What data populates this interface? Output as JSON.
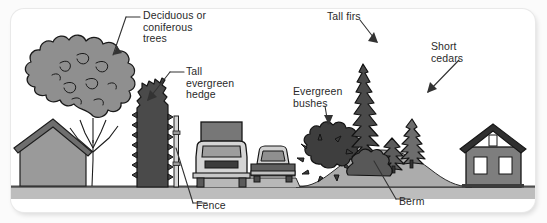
{
  "figure": {
    "width": 547,
    "height": 223
  },
  "colors": {
    "background": "#fbfbfb",
    "card": "#ffffff",
    "ground": "#b4b4b4",
    "ground_line": "#555555",
    "berm": "#a8a8a8",
    "mid_gray": "#8d8d8d",
    "dark_gray": "#5a5a5a",
    "darkest_gray": "#3f3f3f",
    "outline": "#1a1a1a",
    "label_text": "#2a2a2a",
    "leader_line": "#3a3a3a"
  },
  "labels": [
    {
      "id": "deciduous",
      "text": "Deciduous or\nconiferous\ntrees"
    },
    {
      "id": "hedge",
      "text": "Tall\nevergreen\nhedge"
    },
    {
      "id": "tallfirs",
      "text": "Tall firs"
    },
    {
      "id": "cedars",
      "text": "Short\ncedars"
    },
    {
      "id": "evergreen",
      "text": "Evergreen\nbushes"
    },
    {
      "id": "fence",
      "text": "Fence"
    },
    {
      "id": "berm",
      "text": "Berm"
    }
  ],
  "scene": {
    "elements": [
      "house-left",
      "deciduous-tree",
      "evergreen-hedge",
      "wood-fence",
      "truck",
      "car",
      "roadway",
      "evergreen-bush",
      "tall-fir",
      "short-cedars",
      "berm-mound",
      "house-right"
    ]
  }
}
